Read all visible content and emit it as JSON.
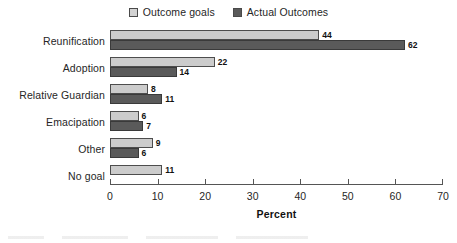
{
  "chart_data": {
    "type": "bar",
    "orientation": "horizontal",
    "title": "",
    "xlabel": "Percent",
    "ylabel": "",
    "xlim": [
      0,
      70
    ],
    "xticks": [
      0,
      10,
      20,
      30,
      40,
      50,
      60,
      70
    ],
    "grid": false,
    "legend_position": "top-center",
    "categories": [
      "Reunification",
      "Adoption",
      "Relative Guardian",
      "Emacipation",
      "Other",
      "No goal"
    ],
    "series": [
      {
        "name": "Outcome goals",
        "color": "#cccccc",
        "values": [
          44,
          22,
          8,
          6,
          9,
          11
        ]
      },
      {
        "name": "Actual Outcomes",
        "color": "#5a5a5a",
        "values": [
          62,
          14,
          11,
          7,
          6,
          null
        ]
      }
    ],
    "value_labels": {
      "Reunification": {
        "goals": "44",
        "actual": "62"
      },
      "Adoption": {
        "goals": "22",
        "actual": "14"
      },
      "Relative Guardian": {
        "goals": "8",
        "actual": "11"
      },
      "Emacipation": {
        "goals": "6",
        "actual": "7"
      },
      "Other": {
        "goals": "9",
        "actual": "6"
      },
      "No goal": {
        "goals": "11",
        "actual": ""
      }
    }
  },
  "legend": {
    "entries": [
      {
        "label": "Outcome goals",
        "swatch": "light-gray"
      },
      {
        "label": "Actual Outcomes",
        "swatch": "dark-gray"
      }
    ]
  },
  "axis": {
    "x_tick_labels": [
      "0",
      "10",
      "20",
      "30",
      "40",
      "50",
      "60",
      "70"
    ],
    "x_axis_title": "Percent"
  },
  "colors": {
    "outcome_goals": "#cccccc",
    "actual_outcomes": "#5a5a5a",
    "axis": "#555555",
    "text": "#262626",
    "background": "#ffffff"
  }
}
